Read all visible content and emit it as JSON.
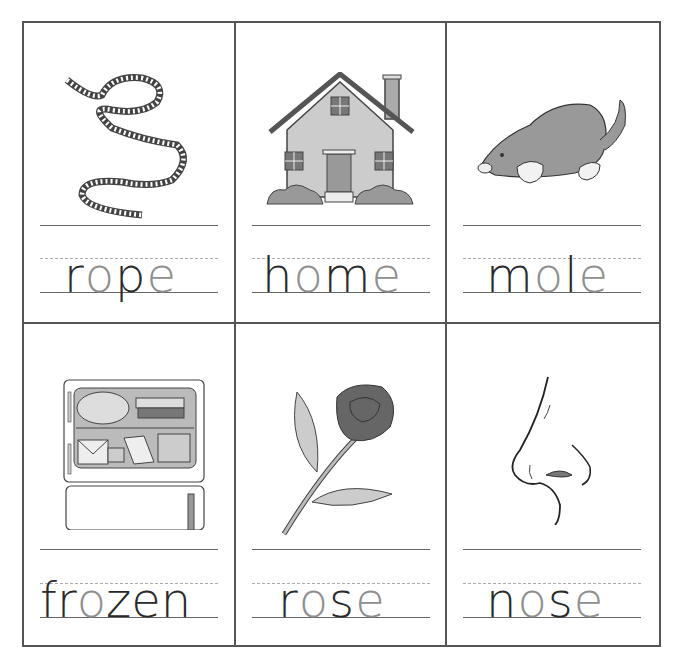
{
  "worksheet": {
    "colors": {
      "border": "#555555",
      "dark_letter": "#2a2a2a",
      "light_letter": "#8f8f8f",
      "guide_line": "#666666",
      "dashed_line": "#aaaaaa"
    },
    "cards": [
      {
        "word": "rope",
        "picture": "rope-icon",
        "letters": [
          {
            "ch": "r",
            "tone": "dark"
          },
          {
            "ch": "o",
            "tone": "light"
          },
          {
            "ch": "p",
            "tone": "dark"
          },
          {
            "ch": "e",
            "tone": "light"
          }
        ]
      },
      {
        "word": "home",
        "picture": "house-icon",
        "letters": [
          {
            "ch": "h",
            "tone": "dark"
          },
          {
            "ch": "o",
            "tone": "light"
          },
          {
            "ch": "m",
            "tone": "dark"
          },
          {
            "ch": "e",
            "tone": "light"
          }
        ]
      },
      {
        "word": "mole",
        "picture": "mole-icon",
        "letters": [
          {
            "ch": "m",
            "tone": "dark"
          },
          {
            "ch": "o",
            "tone": "light"
          },
          {
            "ch": "l",
            "tone": "dark"
          },
          {
            "ch": "e",
            "tone": "light"
          }
        ]
      },
      {
        "word": "frozen",
        "picture": "freezer-icon",
        "letters": [
          {
            "ch": "f",
            "tone": "dark"
          },
          {
            "ch": "r",
            "tone": "dark"
          },
          {
            "ch": "o",
            "tone": "light"
          },
          {
            "ch": "z",
            "tone": "dark"
          },
          {
            "ch": "e",
            "tone": "dark"
          },
          {
            "ch": "n",
            "tone": "dark"
          }
        ]
      },
      {
        "word": "rose",
        "picture": "rose-icon",
        "letters": [
          {
            "ch": "r",
            "tone": "dark"
          },
          {
            "ch": "o",
            "tone": "light"
          },
          {
            "ch": "s",
            "tone": "dark"
          },
          {
            "ch": "e",
            "tone": "light"
          }
        ]
      },
      {
        "word": "nose",
        "picture": "nose-icon",
        "letters": [
          {
            "ch": "n",
            "tone": "dark"
          },
          {
            "ch": "o",
            "tone": "light"
          },
          {
            "ch": "s",
            "tone": "dark"
          },
          {
            "ch": "e",
            "tone": "light"
          }
        ]
      }
    ]
  }
}
